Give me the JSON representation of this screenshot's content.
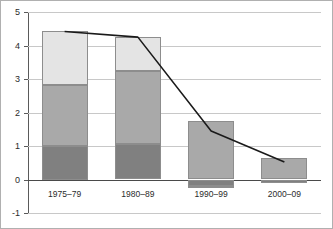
{
  "chart_data": {
    "type": "bar",
    "subtype": "stacked-bar-with-line-overlay",
    "title": "",
    "subtitle": "",
    "xlabel": "",
    "ylabel": "",
    "categories": [
      "1975–79",
      "1980–89",
      "1990–99",
      "2000–09"
    ],
    "ylim": [
      -1,
      5
    ],
    "yticks": [
      -1,
      0,
      1,
      2,
      3,
      4,
      5
    ],
    "ytick_labels": [
      "-1",
      "0",
      "1",
      "2",
      "3",
      "4",
      "5"
    ],
    "grid": true,
    "legend": "none",
    "series": [
      {
        "name": "series-1-dark-gray",
        "color": "#808080",
        "type": "bar",
        "stack": "total",
        "values": [
          1.0,
          1.07,
          -0.2,
          -0.1
        ]
      },
      {
        "name": "series-2-medium-gray",
        "color": "#a9a9a9",
        "type": "bar",
        "stack": "total",
        "values": [
          1.82,
          2.18,
          1.75,
          0.65
        ]
      },
      {
        "name": "series-3-light-gray",
        "color": "#e4e4e4",
        "type": "bar",
        "stack": "total",
        "values": [
          1.6,
          1.0,
          -0.05,
          0.0
        ]
      },
      {
        "name": "series-4-line",
        "color": "#1a1a1a",
        "type": "line",
        "values": [
          4.42,
          4.25,
          1.45,
          0.52
        ]
      }
    ],
    "bar_totals": [
      4.42,
      4.25,
      1.5,
      0.55
    ],
    "annotations": []
  },
  "axes": {
    "y_labels": [
      "5",
      "4",
      "3",
      "2",
      "1",
      "0",
      "-1"
    ],
    "x_labels": [
      "1975–79",
      "1980–89",
      "1990–99",
      "2000–09"
    ]
  },
  "colors": {
    "dark_gray": "#808080",
    "medium_gray": "#a9a9a9",
    "light_gray": "#e4e4e4",
    "line": "#1a1a1a",
    "gridline": "#c8c8c8",
    "axis": "#5a5a5a",
    "background": "#ffffff"
  }
}
